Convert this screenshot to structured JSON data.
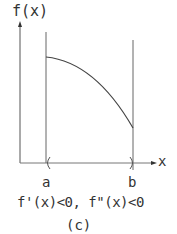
{
  "diagram": {
    "y_axis_label": "f(x)",
    "x_axis_label": "x",
    "left_bound_label": "a",
    "right_bound_label": "b",
    "condition": "f'(x)<0, f\"(x)<0",
    "caption": "(c)",
    "curve": {
      "description": "decreasing, concave-down curve from x=a to x=b",
      "start": {
        "x": "a",
        "y": "high"
      },
      "end": {
        "x": "b",
        "y": "low"
      }
    },
    "colors": {
      "line": "#555555",
      "text": "#333333"
    }
  }
}
